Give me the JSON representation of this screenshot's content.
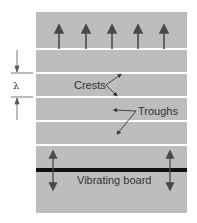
{
  "diagram": {
    "labels": {
      "crests": "Crests",
      "troughs": "Troughs",
      "board": "Vibrating board",
      "wavelength": "λ"
    },
    "colors": {
      "medium": "#bdbdbd",
      "wavefront": "#ffffff",
      "board": "#111111",
      "arrow": "#4a4a4a"
    },
    "wavefront_count": 5,
    "propagation_arrow_count": 5,
    "board_arrow_count": 2
  }
}
